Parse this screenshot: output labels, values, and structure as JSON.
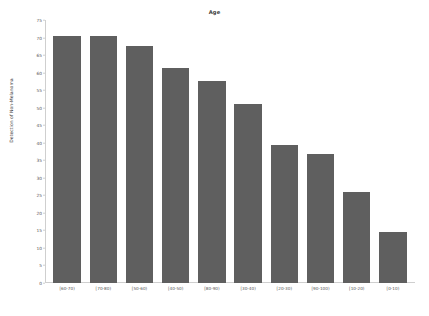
{
  "chart_data": {
    "type": "bar",
    "title": "Age",
    "xlabel": "",
    "ylabel": "Detection of Non-Melanoma",
    "categories": [
      "[60-70)",
      "[70-80)",
      "[50-60)",
      "[40-50)",
      "[80-90)",
      "[30-40)",
      "[20-30)",
      "[90-100)",
      "[10-20)",
      "[0-10)"
    ],
    "values": [
      70.4,
      70.4,
      67.6,
      61.3,
      57.6,
      51.0,
      39.3,
      36.8,
      26.0,
      14.5
    ],
    "ylim": [
      0,
      75
    ],
    "yticks": [
      75,
      70,
      65,
      60,
      55,
      50,
      45,
      40,
      35,
      30,
      25,
      20,
      15,
      10,
      5,
      0
    ],
    "ytick_labels": [
      "75",
      "70",
      "65",
      "60",
      "55",
      "50",
      "45",
      "40",
      "35",
      "30",
      "25",
      "20",
      "15",
      "10",
      "5",
      "0"
    ],
    "grid": false,
    "legend": null,
    "bar_color": "#5f5f5f",
    "background_color": "#ffffff",
    "axis_color": "#cfcfcf",
    "text_color": "#555555"
  }
}
